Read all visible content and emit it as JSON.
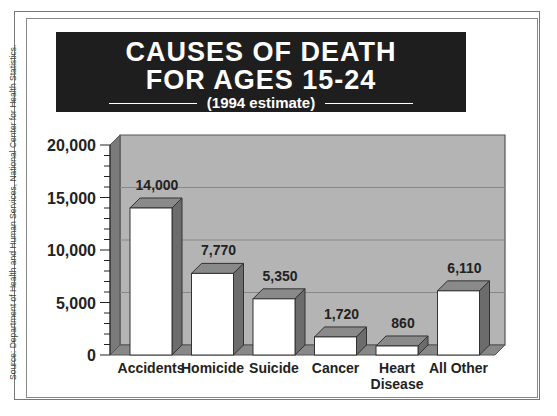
{
  "chart_data": {
    "type": "bar",
    "title": "CAUSES OF DEATH FOR AGES 15-24",
    "subtitle": "(1994 estimate)",
    "categories": [
      "Accidents",
      "Homicide",
      "Suicide",
      "Cancer",
      "Heart Disease",
      "All Other"
    ],
    "values": [
      14000,
      7770,
      5350,
      1720,
      860,
      6110
    ],
    "value_labels": [
      "14,000",
      "7,770",
      "5,350",
      "1,720",
      "860",
      "6,110"
    ],
    "xlabel": "",
    "ylabel": "",
    "ylim": [
      0,
      20000
    ],
    "yticks": [
      "0",
      "5,000",
      "10,000",
      "15,000",
      "20,000"
    ],
    "grid": true,
    "style": "3d",
    "source": "Source: Department of Health and Human Services, National Center for Health Statistics."
  },
  "header": {
    "line1": "CAUSES OF DEATH",
    "line2": "FOR AGES 15-24",
    "line3": "(1994 estimate)"
  },
  "source": "Source: Department of Health and Human Services, National Center for Health Statistics."
}
